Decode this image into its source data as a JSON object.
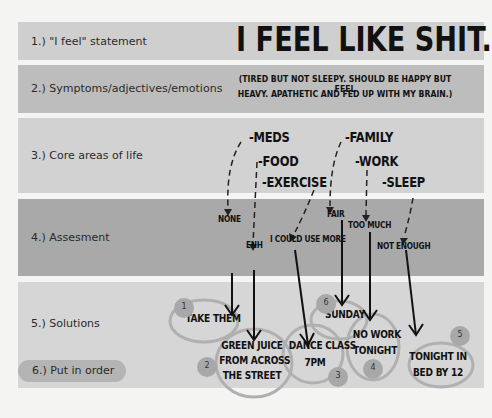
{
  "rows": [
    {
      "label": "1.) \"I feel\" statement"
    },
    {
      "label": "2.) Symptoms/adjectives/emotions"
    },
    {
      "label": "3.) Core areas of life"
    },
    {
      "label": "4.) Assesment"
    },
    {
      "label": "5.) Solutions"
    },
    {
      "label": "6.) Put in order"
    }
  ],
  "statement": "I FEEL LIKE SHIT.",
  "symptoms": {
    "line1": "(TIRED BUT NOT SLEEPY. SHOULD BE HAPPY BUT FEEL",
    "line2": "HEAVY. APATHETIC AND FED UP WITH MY BRAIN.)"
  },
  "core_areas": [
    {
      "label": "-MEDS"
    },
    {
      "label": "-FOOD"
    },
    {
      "label": "-EXERCISE"
    },
    {
      "label": "-FAMILY"
    },
    {
      "label": "-WORK"
    },
    {
      "label": "-SLEEP"
    }
  ],
  "assessments": [
    {
      "area": "MEDS",
      "label": "NONE"
    },
    {
      "area": "FOOD",
      "label": "ENH"
    },
    {
      "area": "EXERCISE",
      "label": "I COULD USE MORE"
    },
    {
      "area": "FAMILY",
      "label": "FAIR"
    },
    {
      "area": "WORK",
      "label": "TOO MUCH"
    },
    {
      "area": "SLEEP",
      "label": "NOT ENOUGH"
    }
  ],
  "solutions": [
    {
      "order": "1",
      "lines": [
        "TAKE THEM"
      ]
    },
    {
      "order": "2",
      "lines": [
        "GREEN JUICE",
        "FROM ACROSS",
        "THE STREET"
      ]
    },
    {
      "order": "3",
      "lines": [
        "DANCE CLASS",
        "7PM"
      ]
    },
    {
      "order": "6",
      "lines": [
        "SUNDAY"
      ]
    },
    {
      "order": "4",
      "lines": [
        "NO WORK",
        "TONIGHT"
      ]
    },
    {
      "order": "5",
      "lines": [
        "TONIGHT IN",
        "BED BY 12"
      ]
    }
  ],
  "colors": {
    "background": "#f4f4f3",
    "band1": "#cfcfcf",
    "band2": "#bdbdbd",
    "band3": "#d2d2d2",
    "band4": "#a9a9a9",
    "band5": "#d6d6d6",
    "circle_stroke": "#9a9a9a",
    "number_badge": "#a8a8a8"
  }
}
